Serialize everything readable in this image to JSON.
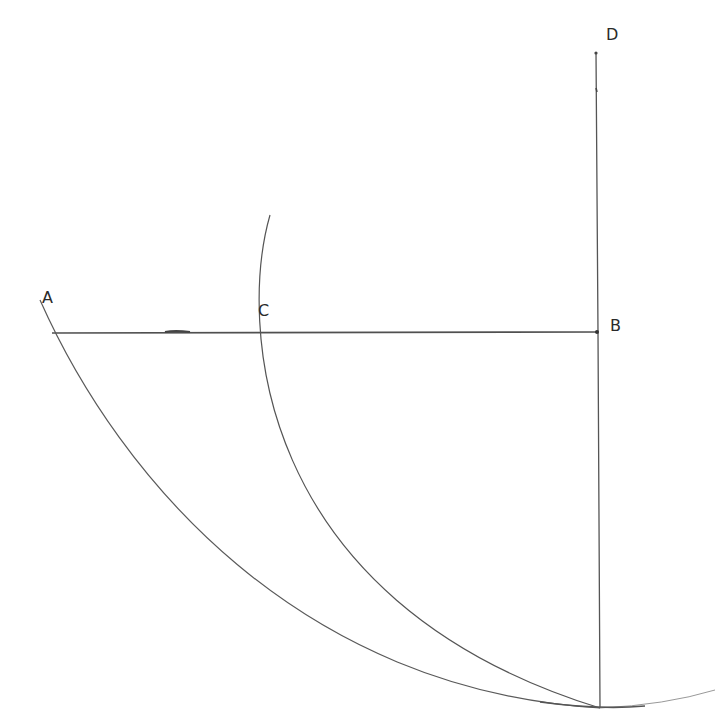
{
  "diagram": {
    "type": "geometric-construction",
    "style": "hand-drawn pencil",
    "stroke_color": "#555555",
    "labels": [
      {
        "id": "A",
        "text": "A",
        "x": 42,
        "y": 290
      },
      {
        "id": "C",
        "text": "C",
        "x": 258,
        "y": 303
      },
      {
        "id": "B",
        "text": "B",
        "x": 610,
        "y": 318
      },
      {
        "id": "D",
        "text": "D",
        "x": 606,
        "y": 27
      }
    ],
    "points": {
      "A": [
        52,
        333
      ],
      "C": [
        256,
        331
      ],
      "B": [
        597,
        332
      ],
      "D": [
        596,
        52
      ],
      "bottom": [
        600,
        708
      ]
    },
    "segments": [
      {
        "name": "A-B horizontal line",
        "from": "A",
        "to": "B"
      },
      {
        "name": "D-bottom vertical line",
        "from": "D",
        "to": "bottom"
      }
    ],
    "arcs": [
      {
        "name": "outer arc through A",
        "from": [
          40,
          300
        ],
        "through": "A",
        "to": [
          715,
          690
        ]
      },
      {
        "name": "inner arc through C",
        "from": [
          270,
          215
        ],
        "through": "C",
        "to": [
          600,
          708
        ]
      }
    ]
  }
}
